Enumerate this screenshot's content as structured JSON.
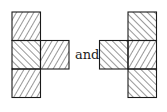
{
  "connector_text": "and",
  "colors": {
    "stroke": "#1a1a1a",
    "background": "#ffffff"
  },
  "figures": [
    {
      "name": "left-figure",
      "description": "T-shaped pentomino-like arrangement: vertical column of 3 squares with one square attached to the right of the middle",
      "cells": [
        {
          "id": "top",
          "hatch": "forward"
        },
        {
          "id": "middle",
          "hatch": "backward"
        },
        {
          "id": "right-arm",
          "hatch": "forward"
        },
        {
          "id": "bottom",
          "hatch": "forward"
        }
      ]
    },
    {
      "name": "right-figure",
      "description": "Mirror arrangement: vertical column of 3 squares with one square attached to the left of the middle",
      "cells": [
        {
          "id": "top",
          "hatch": "backward"
        },
        {
          "id": "left-arm",
          "hatch": "backward"
        },
        {
          "id": "middle",
          "hatch": "forward"
        },
        {
          "id": "bottom",
          "hatch": "backward"
        }
      ]
    }
  ]
}
